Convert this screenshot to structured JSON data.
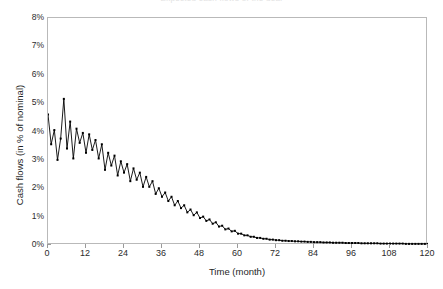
{
  "chart_data": {
    "type": "line",
    "title": "Expected cash flows of the deal",
    "xlabel": "Time (month)",
    "ylabel": "Cash flows (in % of nominal)",
    "xlim": [
      0,
      120
    ],
    "ylim": [
      0,
      8
    ],
    "grid": false,
    "legend": null,
    "line_color": "#000000",
    "marker": "square",
    "marker_size": 2,
    "x_tick_labels": [
      "0",
      "12",
      "24",
      "36",
      "48",
      "60",
      "72",
      "84",
      "96",
      "108",
      "120"
    ],
    "x_ticks": [
      0,
      12,
      24,
      36,
      48,
      60,
      72,
      84,
      96,
      108,
      120
    ],
    "y_tick_labels": [
      "0%",
      "1%",
      "2%",
      "3%",
      "4%",
      "5%",
      "6%",
      "7%",
      "8%"
    ],
    "y_ticks": [
      0,
      1,
      2,
      3,
      4,
      5,
      6,
      7,
      8
    ],
    "x": [
      0,
      1,
      2,
      3,
      4,
      5,
      6,
      7,
      8,
      9,
      10,
      11,
      12,
      13,
      14,
      15,
      16,
      17,
      18,
      19,
      20,
      21,
      22,
      23,
      24,
      25,
      26,
      27,
      28,
      29,
      30,
      31,
      32,
      33,
      34,
      35,
      36,
      37,
      38,
      39,
      40,
      41,
      42,
      43,
      44,
      45,
      46,
      47,
      48,
      49,
      50,
      51,
      52,
      53,
      54,
      55,
      56,
      57,
      58,
      59,
      60,
      61,
      62,
      63,
      64,
      65,
      66,
      67,
      68,
      69,
      70,
      71,
      72,
      73,
      74,
      75,
      76,
      77,
      78,
      79,
      80,
      81,
      82,
      83,
      84,
      85,
      86,
      87,
      88,
      89,
      90,
      91,
      92,
      93,
      94,
      95,
      96,
      97,
      98,
      99,
      100,
      101,
      102,
      103,
      104,
      105,
      106,
      107,
      108,
      109,
      110,
      111,
      112,
      113,
      114,
      115,
      116,
      117,
      118,
      119,
      120
    ],
    "values": [
      4.6,
      3.55,
      4.05,
      3.0,
      3.75,
      5.15,
      3.4,
      4.35,
      3.05,
      4.1,
      3.6,
      3.95,
      3.25,
      3.9,
      3.35,
      3.7,
      3.05,
      3.55,
      2.65,
      3.25,
      2.8,
      3.15,
      2.45,
      2.95,
      2.55,
      2.85,
      2.25,
      2.7,
      2.3,
      2.55,
      2.05,
      2.4,
      2.05,
      2.25,
      1.8,
      2.0,
      1.7,
      1.85,
      1.55,
      1.7,
      1.4,
      1.55,
      1.3,
      1.4,
      1.15,
      1.25,
      1.05,
      1.15,
      0.95,
      1.0,
      0.85,
      0.9,
      0.75,
      0.8,
      0.65,
      0.68,
      0.55,
      0.58,
      0.48,
      0.5,
      0.4,
      0.4,
      0.34,
      0.34,
      0.29,
      0.29,
      0.25,
      0.25,
      0.22,
      0.22,
      0.19,
      0.19,
      0.17,
      0.17,
      0.15,
      0.15,
      0.14,
      0.14,
      0.13,
      0.13,
      0.12,
      0.12,
      0.11,
      0.11,
      0.1,
      0.1,
      0.1,
      0.09,
      0.09,
      0.09,
      0.08,
      0.08,
      0.08,
      0.08,
      0.07,
      0.07,
      0.07,
      0.07,
      0.07,
      0.06,
      0.06,
      0.06,
      0.06,
      0.06,
      0.06,
      0.05,
      0.05,
      0.05,
      0.05,
      0.05,
      0.05,
      0.05,
      0.05,
      0.04,
      0.04,
      0.04,
      0.04,
      0.04,
      0.04,
      0.04,
      0.04
    ]
  }
}
